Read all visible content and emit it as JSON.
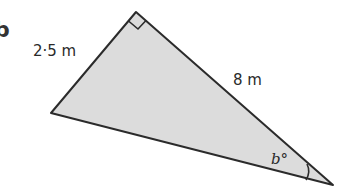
{
  "diagram": {
    "part_label": "b",
    "triangle": {
      "vertices": {
        "top": [
          136,
          12
        ],
        "left": [
          51,
          113
        ],
        "right": [
          333,
          185
        ]
      },
      "fill": "#dcdcdc",
      "stroke": "#2b2b2b",
      "right_angle_at": "top"
    },
    "labels": {
      "side_short": "2·5 m",
      "side_long": "8 m",
      "angle": "b°"
    }
  }
}
